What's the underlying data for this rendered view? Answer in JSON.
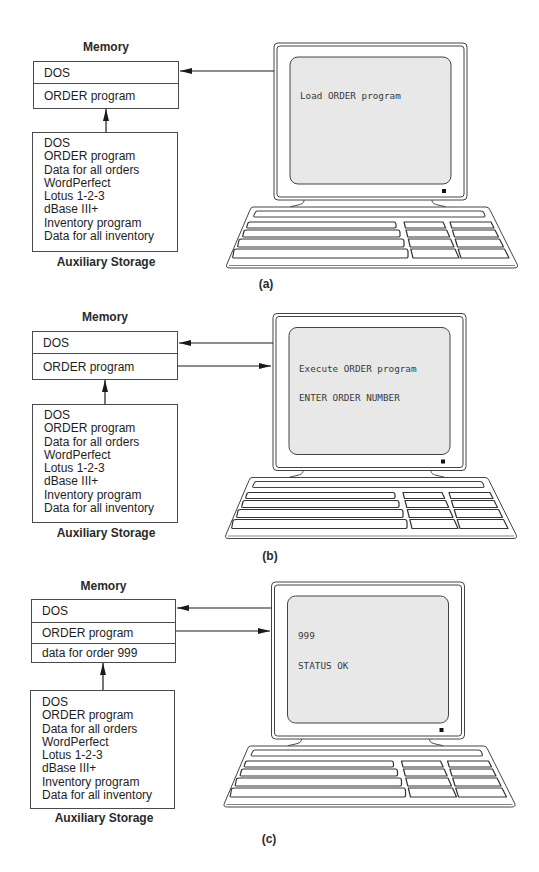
{
  "colors": {
    "line": "#444444",
    "text": "#1e1e1e",
    "screen": "#e8e8e8"
  },
  "panels": [
    {
      "caption": "(a)",
      "memory": {
        "title": "Memory",
        "rows": [
          "DOS",
          "ORDER program"
        ]
      },
      "storage": {
        "title": "Auxiliary Storage",
        "items": [
          "DOS",
          "ORDER program",
          "Data for all orders",
          "WordPerfect",
          "Lotus 1-2-3",
          "dBase III+",
          "Inventory program",
          "Data for all inventory"
        ]
      },
      "screen": {
        "lines": [
          "Load ORDER program"
        ]
      },
      "connections": [
        {
          "from": "Auxiliary Storage",
          "to": "Memory"
        },
        {
          "from": "Computer",
          "to": "DOS"
        }
      ]
    },
    {
      "caption": "(b)",
      "memory": {
        "title": "Memory",
        "rows": [
          "DOS",
          "ORDER program"
        ]
      },
      "storage": {
        "title": "Auxiliary Storage",
        "items": [
          "DOS",
          "ORDER program",
          "Data for all orders",
          "WordPerfect",
          "Lotus 1-2-3",
          "dBase III+",
          "Inventory program",
          "Data for all inventory"
        ]
      },
      "screen": {
        "lines": [
          "Execute ORDER program",
          "ENTER ORDER NUMBER"
        ]
      },
      "connections": [
        {
          "from": "Auxiliary Storage",
          "to": "Memory"
        },
        {
          "from": "Computer",
          "to": "DOS"
        },
        {
          "from": "ORDER program",
          "to": "Computer"
        }
      ]
    },
    {
      "caption": "(c)",
      "memory": {
        "title": "Memory",
        "rows": [
          "DOS",
          "ORDER program",
          "data for order 999"
        ]
      },
      "storage": {
        "title": "Auxiliary Storage",
        "items": [
          "DOS",
          "ORDER program",
          "Data for all orders",
          "WordPerfect",
          "Lotus 1-2-3",
          "dBase III+",
          "Inventory program",
          "Data for all inventory"
        ]
      },
      "screen": {
        "lines": [
          "999",
          "STATUS OK"
        ]
      },
      "connections": [
        {
          "from": "Auxiliary Storage",
          "to": "Memory"
        },
        {
          "from": "Computer",
          "to": "DOS"
        },
        {
          "from": "ORDER program",
          "to": "Computer"
        }
      ]
    }
  ]
}
